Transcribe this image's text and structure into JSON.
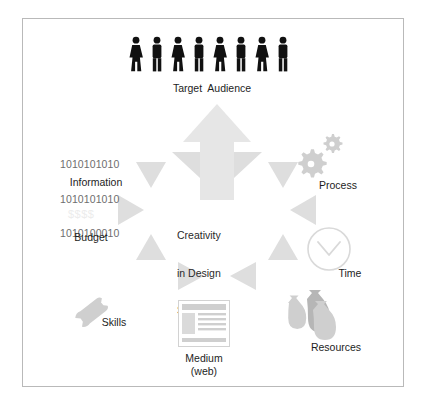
{
  "diagram": {
    "title_center": "Creativity\nin Design\nSolutions",
    "center_lines": [
      "Creativity",
      "in Design",
      "Solutions"
    ],
    "background_color": "#ffffff",
    "border_color": "#b9b9b9",
    "arrow_color": "#e3e3e3",
    "triangle_color": "#dcdcdc",
    "icon_gray": "#c9c9c9",
    "icon_gray_dark": "#b0b0b0",
    "figure_color": "#111111",
    "text_color": "#1d1d1d",
    "binary_text_color": "#6e6e6e",
    "nodes": [
      {
        "id": "target-audience",
        "label": "Target  Audience",
        "icon": "people-group-icon"
      },
      {
        "id": "process",
        "label": "Process",
        "icon": "gears-icon"
      },
      {
        "id": "time",
        "label": "Time",
        "icon": "clock-icon"
      },
      {
        "id": "resources",
        "label": "Resources",
        "icon": "money-bags-icon"
      },
      {
        "id": "medium",
        "label": "Medium\n(web)",
        "label_line1": "Medium",
        "label_line2": "(web)",
        "icon": "web-page-icon"
      },
      {
        "id": "skills",
        "label": "Skills",
        "icon": "wrench-icon"
      },
      {
        "id": "budget",
        "label": "Budget",
        "icon": "dollar-signs-icon",
        "icon_text": "$$$$"
      },
      {
        "id": "information",
        "label": "Information",
        "icon": "binary-digits-icon",
        "binary_lines": [
          "1010101010",
          "1010101010",
          "1010100010"
        ]
      }
    ],
    "flow": {
      "big_arrow_direction": "up",
      "big_arrow_target": "Target  Audience",
      "inward_triangle_count": 8
    }
  }
}
